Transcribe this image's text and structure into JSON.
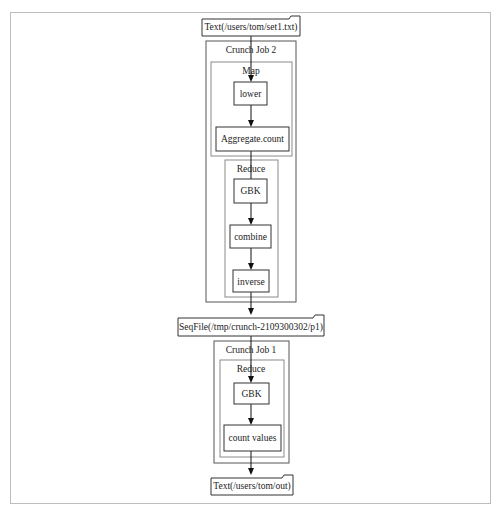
{
  "diagram": {
    "type": "dataflow-pipeline",
    "nodes": {
      "input_file": "Text(/users/tom/set1.txt)",
      "intermediate_file": "SeqFile(/tmp/crunch-2109300302/p1)",
      "output_file": "Text(/users/tom/out)"
    },
    "job2": {
      "title": "Crunch Job 2",
      "map": {
        "title": "Map",
        "steps": [
          "lower",
          "Aggregate.count"
        ]
      },
      "reduce": {
        "title": "Reduce",
        "steps": [
          "GBK",
          "combine",
          "inverse"
        ]
      }
    },
    "job1": {
      "title": "Crunch Job 1",
      "reduce": {
        "title": "Reduce",
        "steps": [
          "GBK",
          "count values"
        ]
      }
    },
    "edges": [
      [
        "Text(/users/tom/set1.txt)",
        "lower"
      ],
      [
        "lower",
        "Aggregate.count"
      ],
      [
        "Aggregate.count",
        "GBK"
      ],
      [
        "GBK",
        "combine"
      ],
      [
        "combine",
        "inverse"
      ],
      [
        "inverse",
        "SeqFile(/tmp/crunch-2109300302/p1)"
      ],
      [
        "SeqFile(/tmp/crunch-2109300302/p1)",
        "GBK"
      ],
      [
        "GBK",
        "count values"
      ],
      [
        "count values",
        "Text(/users/tom/out)"
      ]
    ]
  }
}
